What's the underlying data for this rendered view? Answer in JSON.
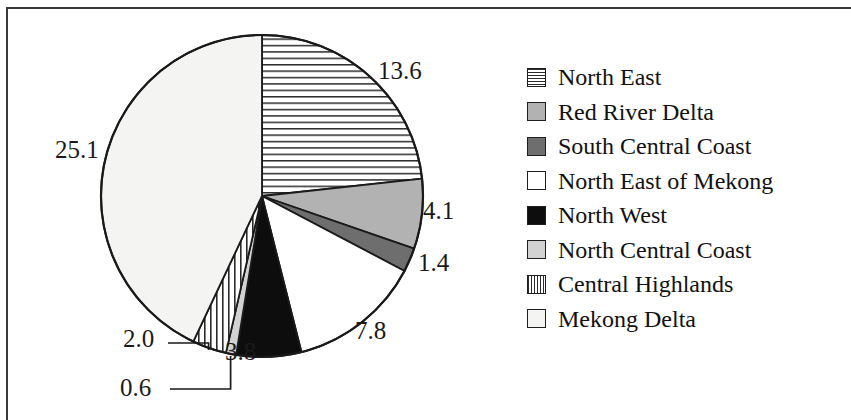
{
  "chart_data": {
    "type": "pie",
    "title": "",
    "subtitle": "",
    "xlabel": "",
    "ylabel": "",
    "legend_position": "right",
    "grid": false,
    "start_angle_deg": 0,
    "direction": "clockwise",
    "total": 58.4,
    "categories": [
      "North East",
      "Red River Delta",
      "South Central Coast",
      "North East of Mekong",
      "North West",
      "North Central Coast",
      "Central Highlands",
      "Mekong Delta"
    ],
    "values": [
      13.6,
      4.1,
      1.4,
      7.8,
      3.8,
      0.6,
      2.0,
      25.1
    ],
    "value_labels": [
      "13.6",
      "4.1",
      "1.4",
      "7.8",
      "3.8",
      "0.6",
      "2.0",
      "25.1"
    ],
    "slices": [
      {
        "label": "North East",
        "value": 13.6,
        "value_text": "13.6",
        "pattern": "horizontal-stripes",
        "fill": "#ffffff",
        "stroke": "#1a1a1a",
        "start_deg": 0.0,
        "end_deg": 83.84,
        "label_placement": "outside-right",
        "leader_line": false
      },
      {
        "label": "Red River Delta",
        "value": 4.1,
        "value_text": "4.1",
        "pattern": "solid",
        "fill": "#b2b2b2",
        "stroke": "#1a1a1a",
        "start_deg": 83.84,
        "end_deg": 109.11,
        "label_placement": "outside-right",
        "leader_line": false
      },
      {
        "label": "South Central Coast",
        "value": 1.4,
        "value_text": "1.4",
        "pattern": "solid",
        "fill": "#6e6e6e",
        "stroke": "#1a1a1a",
        "start_deg": 109.11,
        "end_deg": 117.74,
        "label_placement": "outside-right",
        "leader_line": false
      },
      {
        "label": "North East of Mekong",
        "value": 7.8,
        "value_text": "7.8",
        "pattern": "solid",
        "fill": "#ffffff",
        "stroke": "#1a1a1a",
        "start_deg": 117.74,
        "end_deg": 165.82,
        "label_placement": "outside-bottom-right",
        "leader_line": false
      },
      {
        "label": "North West",
        "value": 3.8,
        "value_text": "3.8",
        "pattern": "solid",
        "fill": "#0d0d0d",
        "stroke": "#1a1a1a",
        "start_deg": 165.82,
        "end_deg": 189.25,
        "label_placement": "outside-bottom",
        "leader_line": false
      },
      {
        "label": "North Central Coast",
        "value": 0.6,
        "value_text": "0.6",
        "pattern": "solid",
        "fill": "#d2d2d2",
        "stroke": "#1a1a1a",
        "start_deg": 189.25,
        "end_deg": 192.95,
        "label_placement": "outside-bottom-left",
        "leader_line": true
      },
      {
        "label": "Central Highlands",
        "value": 2.0,
        "value_text": "2.0",
        "pattern": "vertical-stripes",
        "fill": "#ffffff",
        "stroke": "#1a1a1a",
        "start_deg": 192.95,
        "end_deg": 205.27,
        "label_placement": "outside-bottom-left",
        "leader_line": true
      },
      {
        "label": "Mekong Delta",
        "value": 25.1,
        "value_text": "25.1",
        "pattern": "solid",
        "fill": "#f4f4f2",
        "stroke": "#1a1a1a",
        "start_deg": 205.27,
        "end_deg": 360.0,
        "label_placement": "outside-left",
        "leader_line": false
      }
    ]
  },
  "legend": {
    "items": [
      {
        "label": "North East",
        "swatch": "hstripe"
      },
      {
        "label": "Red River Delta",
        "swatch": "midgray"
      },
      {
        "label": "South Central Coast",
        "swatch": "darkgray"
      },
      {
        "label": "North East of Mekong",
        "swatch": "white"
      },
      {
        "label": "North West",
        "swatch": "black"
      },
      {
        "label": "North Central Coast",
        "swatch": "lightgray"
      },
      {
        "label": "Central Highlands",
        "swatch": "vstripe"
      },
      {
        "label": "Mekong Delta",
        "swatch": "offwhite"
      }
    ]
  },
  "labels": {
    "north_east": "13.6",
    "red_river_delta": "4.1",
    "south_central_coast": "1.4",
    "north_east_of_mekong": "7.8",
    "north_west": "3.8",
    "north_central_coast": "0.6",
    "central_highlands": "2.0",
    "mekong_delta": "25.1"
  },
  "colors": {
    "outline": "#1a1a1a",
    "frame": "#3a3a3a",
    "text": "#111111",
    "mid_gray": "#b2b2b2",
    "dark_gray": "#6e6e6e",
    "light_gray": "#d2d2d2",
    "black_slice": "#0d0d0d",
    "off_white": "#f4f4f2"
  },
  "geometry": {
    "center_x": 262,
    "center_y": 196,
    "radius": 161
  }
}
